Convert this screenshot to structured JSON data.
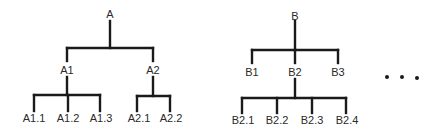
{
  "diagram": {
    "type": "tree-hierarchy",
    "trees": [
      {
        "root": {
          "label": "A",
          "x": 110,
          "y": 15
        },
        "children": [
          {
            "label": "A1",
            "x": 67,
            "y": 71,
            "children": [
              {
                "label": "A1.1",
                "x": 34,
                "y": 119
              },
              {
                "label": "A1.2",
                "x": 68,
                "y": 119
              },
              {
                "label": "A1.3",
                "x": 100,
                "y": 119
              }
            ]
          },
          {
            "label": "A2",
            "x": 153,
            "y": 71,
            "children": [
              {
                "label": "A2.1",
                "x": 137,
                "y": 119
              },
              {
                "label": "A2.2",
                "x": 170,
                "y": 119
              }
            ]
          }
        ]
      },
      {
        "root": {
          "label": "B",
          "x": 295,
          "y": 15
        },
        "children": [
          {
            "label": "B1",
            "x": 252,
            "y": 71,
            "children": []
          },
          {
            "label": "B2",
            "x": 295,
            "y": 71,
            "children": [
              {
                "label": "B2.1",
                "x": 242,
                "y": 121
              },
              {
                "label": "B2.2",
                "x": 277,
                "y": 121
              },
              {
                "label": "B2.3",
                "x": 312,
                "y": 121
              },
              {
                "label": "B2.4",
                "x": 346,
                "y": 121
              }
            ]
          },
          {
            "label": "B3",
            "x": 338,
            "y": 71,
            "children": []
          }
        ]
      }
    ],
    "continuation": "..."
  }
}
